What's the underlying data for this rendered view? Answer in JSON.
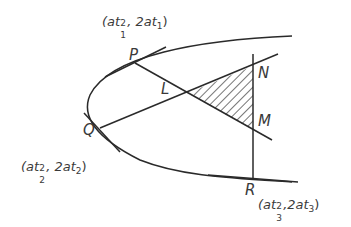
{
  "diagram": {
    "type": "parabola-tangents-normals",
    "colors": {
      "stroke": "#2a2a2a",
      "text": "#3a3a3a",
      "hatch": "#2a2a2a",
      "background": "#ffffff"
    },
    "points": {
      "P": {
        "label": "P",
        "coord_prefix": "(at",
        "sub": "1",
        "sup": "2",
        "coord_mid": ", 2at",
        "coord_suffix": ")"
      },
      "Q": {
        "label": "Q",
        "coord_prefix": "(at",
        "sub": "2",
        "sup": "2",
        "coord_mid": ", 2at",
        "coord_suffix": ")"
      },
      "R": {
        "label": "R",
        "coord_prefix": "(at",
        "sub": "3",
        "sup": "2",
        "coord_mid": ",2at",
        "coord_suffix": ")"
      },
      "L": {
        "label": "L"
      },
      "M": {
        "label": "M"
      },
      "N": {
        "label": "N"
      }
    },
    "shaded_region": "triangle LMN (hatched)"
  }
}
